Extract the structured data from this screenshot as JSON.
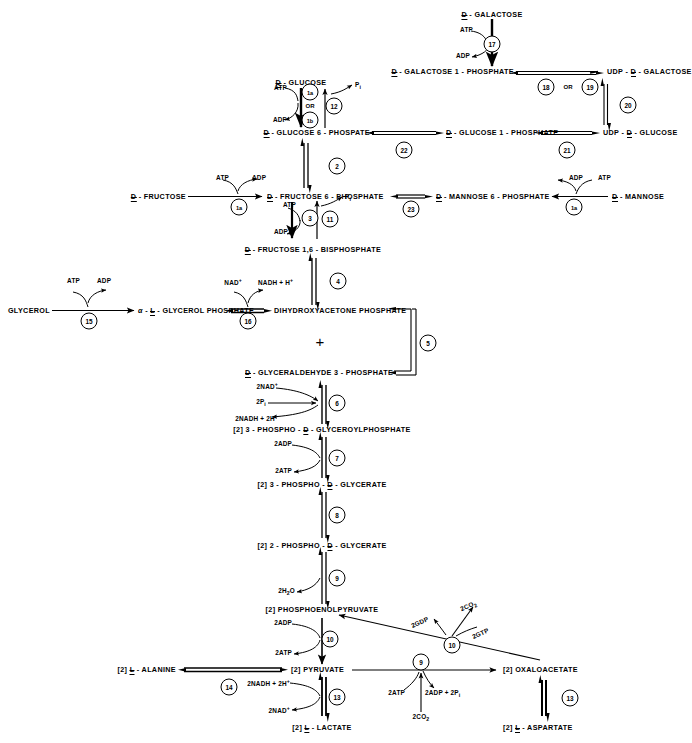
{
  "diagram": {
    "type": "metabolic-pathway"
  },
  "metabolites": {
    "d_galactose": "D - GALACTOSE",
    "d_galactose_1_phosphate": "D - GALACTOSE 1 - PHOSPHATE",
    "udp_d_galactose": "UDP - D - GALACTOSE",
    "d_glucose": "D - GLUCOSE",
    "d_glucose_6_phospate": "D - GLUCOSE 6 - PHOSPATE",
    "d_glucose_1_phosphate": "D - GLUCOSE 1 - PHOSPHATE",
    "udp_d_glucose": "UDP - D - GLUCOSE",
    "d_fructose": "D - FRUCTOSE",
    "d_fructose_6_phosphate": "D - FRUCTOSE 6 - PHOSPHATE",
    "d_mannose_6_phosphate": "D - MANNOSE 6 - PHOSPHATE",
    "d_mannose": "D - MANNOSE",
    "d_fructose_16_bisphosphate": "D - FRUCTOSE 1,6 - BISPHOSPHATE",
    "glycerol": "GLYCEROL",
    "alpha_l_glycerol_phosphate": "α - L - GLYCEROL PHOSPHATE",
    "dihydroxyacetone_phosphate": "DIHYDROXYACETONE PHOSPHATE",
    "d_glyceraldehyde_3_phosphate": "D - GLYCERALDEHYDE 3 - PHOSPHATE",
    "phospho_glyceroylphosphate": "[2] 3 - PHOSPHO - D - GLYCEROYLPHOSPHATE",
    "phospho_3_d_glycerate": "[2] 3 - PHOSPHO - D - GLYCERATE",
    "phospho_2_d_glycerate": "[2] 2 - PHOSPHO - D - GLYCERATE",
    "phosphoenolpyruvate": "[2] PHOSPHOENOLPYRUVATE",
    "pyruvate": "[2] PYRUVATE",
    "l_alanine": "[2] L - ALANINE",
    "l_lactate": "[2] L - LACTATE",
    "oxaloacetate": "[2] OXALOACETATE",
    "l_aspartate": "[2] L - ASPARTATE",
    "plus_sign": "+"
  },
  "cofactors": {
    "atp": "ATP",
    "adp": "ADP",
    "pi": "Pi",
    "nad_plus": "NAD+",
    "nadh_h": "NADH + H+",
    "two_nad_plus": "2NAD+",
    "two_pi": "2Pi",
    "two_nadh_2h": "2NADH + 2H+",
    "two_adp": "2ADP",
    "two_atp": "2ATP",
    "two_h2o": "2H2O",
    "two_nadh_2h_b": "2NADH + 2H+",
    "two_nad_plus_b": "2NAD+",
    "two_adp_2pi": "2ADP + 2Pi",
    "two_co2": "2CO2",
    "two_co2_b": "2CO2",
    "two_gdp": "2GDP",
    "two_gtp": "2GTP"
  },
  "enzymes": [
    {
      "id": "1a",
      "label": "1a",
      "name": "hexokinase"
    },
    {
      "id": "1b",
      "label": "1b",
      "name": "glucokinase"
    },
    {
      "id": "1a2",
      "label": "1a",
      "name": "hexokinase-fructose"
    },
    {
      "id": "1a3",
      "label": "1a",
      "name": "hexokinase-mannose"
    },
    {
      "id": "2",
      "label": "2",
      "name": "phosphoglucose-isomerase"
    },
    {
      "id": "3",
      "label": "3",
      "name": "phosphofructokinase"
    },
    {
      "id": "4",
      "label": "4",
      "name": "aldolase"
    },
    {
      "id": "5",
      "label": "5",
      "name": "triose-phosphate-isomerase"
    },
    {
      "id": "6",
      "label": "6",
      "name": "glyceraldehyde-3-phosphate-dehydrogenase"
    },
    {
      "id": "7",
      "label": "7",
      "name": "phosphoglycerate-kinase"
    },
    {
      "id": "8",
      "label": "8",
      "name": "phosphoglycerate-mutase"
    },
    {
      "id": "9",
      "label": "9",
      "name": "enolase"
    },
    {
      "id": "10",
      "label": "10",
      "name": "pyruvate-kinase"
    },
    {
      "id": "11",
      "label": "11",
      "name": "lactate-dehydrogenase"
    },
    {
      "id": "12",
      "label": "12",
      "name": "pyruvate-carboxylase"
    },
    {
      "id": "13",
      "label": "13",
      "name": "pep-carboxykinase"
    },
    {
      "id": "14",
      "label": "14",
      "name": "fructose-1-6-bisphosphatase"
    },
    {
      "id": "15",
      "label": "15",
      "name": "glucose-6-phosphatase"
    },
    {
      "id": "16",
      "label": "16",
      "name": "aspartate-aminotransferase"
    },
    {
      "id": "17",
      "label": "17",
      "name": "alanine-aminotransferase"
    },
    {
      "id": "18",
      "label": "18",
      "name": "glycerol-kinase"
    },
    {
      "id": "19",
      "label": "19",
      "name": "glycerol-phosphate-dehydrogenase"
    },
    {
      "id": "20",
      "label": "20",
      "name": "galactokinase"
    },
    {
      "id": "21",
      "label": "21",
      "name": "galactose-1-phosphate-uridylyltransferase"
    },
    {
      "id": "22",
      "label": "22",
      "name": "udp-galactose-pyrophosphorylase"
    },
    {
      "id": "23",
      "label": "23",
      "name": "udp-galactose-4-epimerase"
    },
    {
      "id": "24",
      "label": "24",
      "name": "udp-glucose-pyrophosphorylase"
    },
    {
      "id": "25",
      "label": "25",
      "name": "phosphoglucomutase"
    },
    {
      "id": "26",
      "label": "26",
      "name": "phosphomannose-isomerase"
    }
  ],
  "connectors": {
    "or_upper": "OR",
    "or_galactose": "OR"
  }
}
